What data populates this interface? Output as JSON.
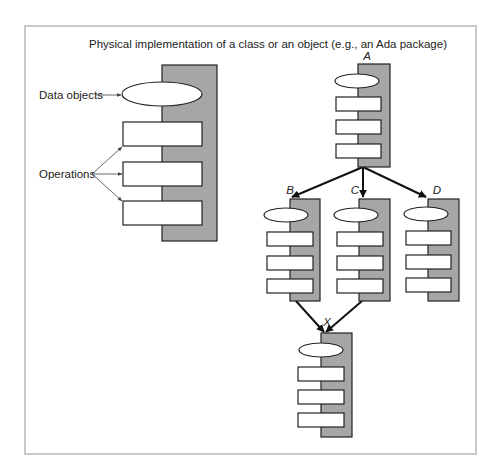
{
  "title": "Physical implementation of a class or an object (e.g., an Ada package)",
  "legend": {
    "data_objects_label": "Data objects",
    "operations_label": "Operations"
  },
  "packages": [
    {
      "id": "A",
      "label": "A",
      "operations": 3
    },
    {
      "id": "B",
      "label": "B",
      "operations": 3
    },
    {
      "id": "C",
      "label": "C",
      "operations": 3
    },
    {
      "id": "D",
      "label": "D",
      "operations": 3
    },
    {
      "id": "X",
      "label": "X",
      "operations": 3
    }
  ],
  "edges": [
    {
      "from": "A",
      "to": "B"
    },
    {
      "from": "A",
      "to": "C"
    },
    {
      "from": "A",
      "to": "D"
    },
    {
      "from": "B",
      "to": "X"
    },
    {
      "from": "C",
      "to": "X"
    }
  ]
}
